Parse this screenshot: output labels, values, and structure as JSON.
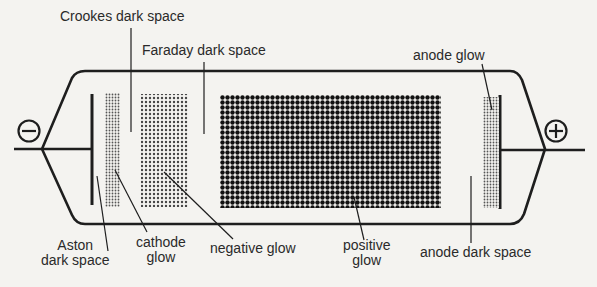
{
  "diagram": {
    "electrodes": {
      "cathode_symbol": "⊖",
      "anode_symbol": "⊕"
    },
    "labels": {
      "crookes": "Crookes dark space",
      "faraday": "Faraday dark space",
      "anode_glow": "anode glow",
      "aston_1": "Aston",
      "aston_2": "dark space",
      "cathode_glow_1": "cathode",
      "cathode_glow_2": "glow",
      "negative_glow": "negative glow",
      "positive_glow_1": "positive",
      "positive_glow_2": "glow",
      "anode_dark": "anode dark space"
    },
    "colors": {
      "ink": "#1e1e1e",
      "background": "#f4f3f0"
    }
  }
}
